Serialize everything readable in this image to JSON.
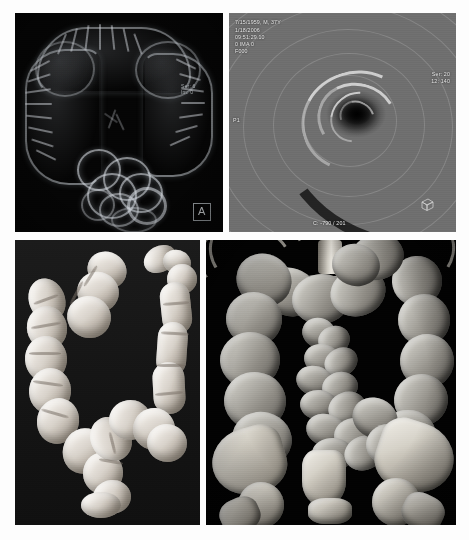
{
  "figure": {
    "background_color": "#fdfdfd",
    "panel_count": 4
  },
  "panels": [
    {
      "id": "panel-a",
      "letter": "A",
      "name": "translucent-3d-colon-overview",
      "modality": "CT colonography translucency rendering",
      "description": "Translucent three-dimensional overview rendering of the whole colon on a black background showing haustral folds and a cluster of distended loops inferiorly",
      "background_color": "#050505",
      "overlay_text": "Ser: 6\nIm: 0"
    },
    {
      "id": "panel-b",
      "letter": "B",
      "name": "virtual-endoscopy-view",
      "modality": "Endoluminal virtual colonoscopy fly-through",
      "description": "Intraluminal endoscopic perspective of the colon lumen with concentric haustral folds converging on a dark central lumen",
      "background_color": "#8b8b8b",
      "header_lines": [
        "7/15/1959, M, 37Y",
        "1/18/2006",
        "09:51:29.10",
        "0 IMA 0",
        "F000"
      ],
      "right_lines": [
        "Ser: 20",
        "12: 140"
      ],
      "left_marker": "P1",
      "bottom_text": "C: -790 / 201",
      "orientation_widget": "orientation-cube"
    },
    {
      "id": "panel-c",
      "letter": "C",
      "name": "surface-rendered-colon",
      "modality": "3D surface-shaded colon display",
      "description": "Three-dimensional surface rendered cast of the air-filled colon isolated on a dark background, haustral indentations clearly visible",
      "background_color": "#161616"
    },
    {
      "id": "panel-d",
      "letter": "D",
      "name": "volume-rendered-abdomen",
      "modality": "3D volume rendering of abdomen and pelvis",
      "description": "Coronal volume rendered view of the gas-distended large and small bowel loops together with the lumbar spine, iliac wings and femoral heads",
      "background_color": "#020202"
    }
  ],
  "colors": {
    "page_background": "#fdfdfd",
    "panel_black": "#000000",
    "overlay_text": "#e8e8e8",
    "label_border": "#9aa0a4",
    "bowel_highlight": "#fdfdfb",
    "bone_highlight": "#f4f2ec"
  }
}
